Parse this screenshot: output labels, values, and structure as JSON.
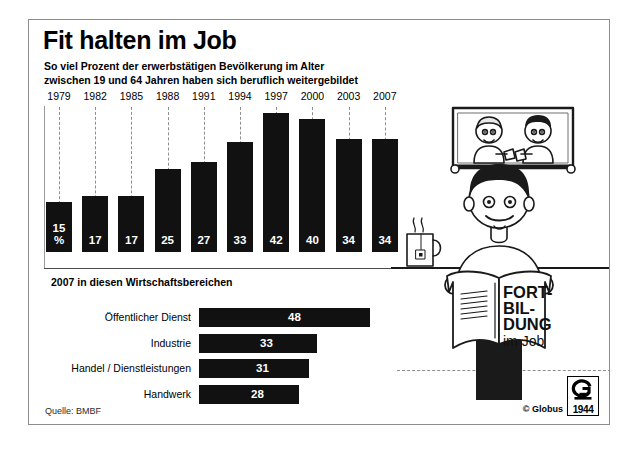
{
  "header": {
    "title": "Fit halten im Job",
    "subtitle_line1": "So viel Prozent der erwerbstätigen Bevölkerung im Alter",
    "subtitle_line2": "zwischen 19 und 64 Jahren haben sich beruflich weitergebildet"
  },
  "section2": {
    "title": "2007 in diesen Wirtschaftsbereichen"
  },
  "footer": {
    "source": "Quelle: BMBF",
    "copyright": "© Globus",
    "logo_year": "1944",
    "logo_letter": "G"
  },
  "illustration": {
    "book_line1": "FORT-",
    "book_line2": "BIL-",
    "book_line3": "DUNG",
    "book_line4": "im Job",
    "reader_name": "man-reading-book",
    "picture_name": "framed-picture-two-people",
    "mug_name": "tea-mug"
  },
  "colors": {
    "bar": "#111111",
    "value_text": "#ffffff",
    "grid": "#8e8e8e",
    "border": "#8c8c8c"
  },
  "chart_data": [
    {
      "type": "bar",
      "name": "weiterbildung-zeitreihe",
      "title": "So viel Prozent der erwerbstätigen Bevölkerung im Alter zwischen 19 und 64 Jahren haben sich beruflich weitergebildet",
      "orientation": "vertical",
      "categories": [
        "1979",
        "1982",
        "1985",
        "1988",
        "1991",
        "1994",
        "1997",
        "2000",
        "2003",
        "2007"
      ],
      "values": [
        15,
        17,
        17,
        25,
        27,
        33,
        42,
        40,
        34,
        34
      ],
      "labels": [
        "15 %",
        "17",
        "17",
        "25",
        "27",
        "33",
        "42",
        "40",
        "34",
        "34"
      ],
      "unit": "%",
      "xlabel": "",
      "ylabel": "",
      "ylim": [
        0,
        44
      ],
      "grid": true,
      "legend": "none"
    },
    {
      "type": "bar",
      "name": "wirtschaftsbereiche-2007",
      "title": "2007 in diesen Wirtschaftsbereichen",
      "orientation": "horizontal",
      "categories": [
        "Öffentlicher Dienst",
        "Industrie",
        "Handel / Dienstleistungen",
        "Handwerk"
      ],
      "values": [
        48,
        33,
        31,
        28
      ],
      "labels": [
        "48",
        "33",
        "31",
        "28"
      ],
      "unit": "%",
      "xlabel": "",
      "ylabel": "",
      "xlim": [
        0,
        48
      ],
      "grid": false,
      "legend": "none"
    }
  ]
}
